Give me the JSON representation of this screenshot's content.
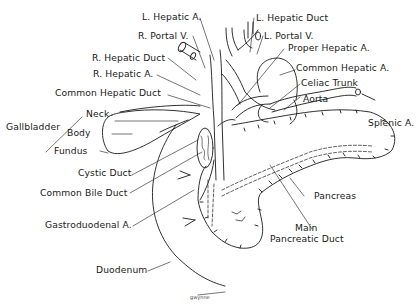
{
  "diagram": {
    "colors": {
      "ink": "#1a1a1a",
      "background": "#ffffff"
    },
    "labels": {
      "left_hepatic_artery": "L. Hepatic A.",
      "right_portal_vein": "R. Portal V.",
      "right_hepatic_duct": "R. Hepatic Duct",
      "right_hepatic_artery": "R. Hepatic A.",
      "common_hepatic_duct": "Common Hepatic Duct",
      "left_hepatic_duct": "L. Hepatic Duct",
      "left_portal_vein": "L. Portal V.",
      "proper_hepatic_artery": "Proper Hepatic A.",
      "common_hepatic_artery": "Common Hepatic A.",
      "celiac_trunk": "Celiac Trunk",
      "aorta": "Aorta",
      "splenic_artery": "Splenic A.",
      "gallbladder": "Gallbladder",
      "neck": "Neck",
      "body": "Body",
      "fundus": "Fundus",
      "cystic_duct": "Cystic Duct",
      "common_bile_duct": "Common Bile Duct",
      "gastroduodenal_artery": "Gastroduodenal A.",
      "pancreas": "Pancreas",
      "main_pancreatic_duct_line1": "Main",
      "main_pancreatic_duct_line2": "Pancreatic Duct",
      "duodenum": "Duodenum"
    },
    "signature": "gwynne"
  }
}
